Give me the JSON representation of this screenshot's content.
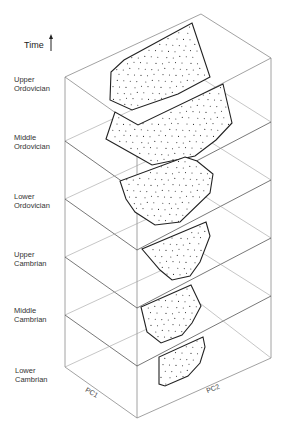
{
  "diagram": {
    "axis_time_label": "Time",
    "axis_x_label": "PC1",
    "axis_y_label": "PC2",
    "layers": [
      {
        "line1": "Upper",
        "line2": "Ordovician"
      },
      {
        "line1": "Middle",
        "line2": "Ordovician"
      },
      {
        "line1": "Lower",
        "line2": "Ordovician"
      },
      {
        "line1": "Upper",
        "line2": "Cambrian"
      },
      {
        "line1": "Middle",
        "line2": "Cambrian"
      },
      {
        "line1": "Lower",
        "line2": "Cambrian"
      }
    ],
    "colors": {
      "box_edge": "#7a7a7a",
      "plane_edge": "#555555",
      "polygon_edge": "#222222",
      "dots": "#333333"
    }
  }
}
